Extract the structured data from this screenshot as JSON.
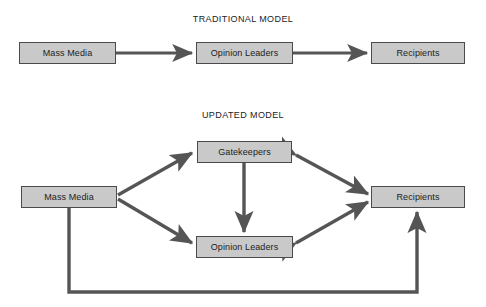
{
  "figure": {
    "kind": "two-part communication flow diagram",
    "background_color": "#ffffff",
    "node_fill": "#c9c9c9",
    "node_border": "#4a4a4a",
    "arrow_color": "#555555",
    "text_color": "#1c1c1c"
  },
  "traditional": {
    "title": "TRADITIONAL MODEL",
    "nodes": {
      "mass_media": "Mass Media",
      "opinion_leaders": "Opinion Leaders",
      "recipients": "Recipients"
    },
    "flows": [
      "Mass Media → Opinion Leaders",
      "Opinion Leaders → Recipients"
    ]
  },
  "updated": {
    "title": "UPDATED MODEL",
    "nodes": {
      "mass_media": "Mass Media",
      "gatekeepers": "Gatekeepers",
      "opinion_leaders": "Opinion Leaders",
      "recipients": "Recipients"
    },
    "flows": [
      "Mass Media → Gatekeepers",
      "Mass Media → Opinion Leaders",
      "Gatekeepers → Opinion Leaders",
      "Gatekeepers ↔ Recipients",
      "Opinion Leaders ↔ Recipients",
      "Mass Media → Recipients (feedback loop)"
    ]
  }
}
